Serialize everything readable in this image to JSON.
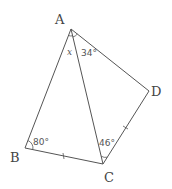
{
  "diagram": {
    "type": "geometry",
    "points": {
      "A": {
        "label": "A",
        "x": 71,
        "y": 29
      },
      "B": {
        "label": "B",
        "x": 25,
        "y": 148
      },
      "C": {
        "label": "C",
        "x": 103,
        "y": 164
      },
      "D": {
        "label": "D",
        "x": 149,
        "y": 91
      }
    },
    "segments": [
      "AB",
      "BC",
      "CD",
      "DA",
      "AC"
    ],
    "equal_marks": [
      "BC",
      "CD"
    ],
    "angles": {
      "BAC": {
        "label": "x",
        "variable": true
      },
      "CAD": {
        "label": "34°",
        "value": 34
      },
      "ABC": {
        "label": "80°",
        "value": 80
      },
      "ACD": {
        "label": "46°",
        "value": 46
      }
    }
  }
}
